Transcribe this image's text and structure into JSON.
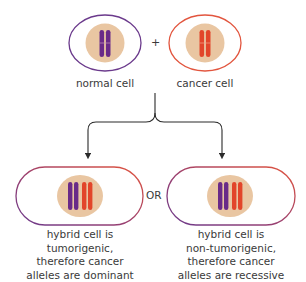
{
  "diagram": {
    "top": {
      "normal_cell": {
        "label": "normal cell",
        "border_color": "#6b3a8c",
        "chromosome_color": "#6a2a88"
      },
      "operator": "+",
      "cancer_cell": {
        "label": "cancer cell",
        "border_color": "#e2553e",
        "chromosome_color": "#e2452a"
      },
      "nucleus_color": "#e9c6a2"
    },
    "connector": "or",
    "outcomes": [
      {
        "id": "dominant",
        "caption_lines": [
          "hybrid cell is",
          "tumorigenic,",
          "therefore cancer",
          "alleles are dominant"
        ]
      },
      {
        "id": "recessive",
        "caption_lines": [
          "hybrid cell is",
          "non-tumorigenic,",
          "therefore cancer",
          "alleles are recessive"
        ]
      }
    ],
    "separator_label": "OR",
    "colors": {
      "purple": "#6b3a8c",
      "red": "#e2553e",
      "arrow": "#2b2b2b",
      "text": "#3a3a3a"
    }
  }
}
